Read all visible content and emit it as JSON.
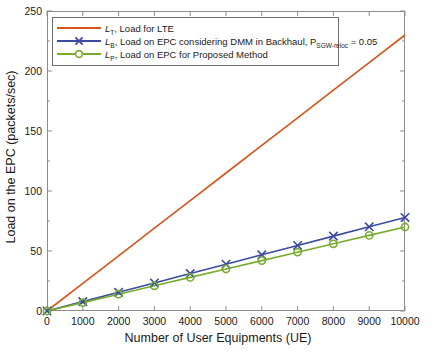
{
  "chart_data": {
    "type": "line",
    "title": "",
    "xlabel": "Number of User Equipments (UE)",
    "ylabel": "Load on the EPC (packets/sec)",
    "xlim": [
      0,
      10000
    ],
    "ylim": [
      0,
      250
    ],
    "xticks": [
      0,
      1000,
      2000,
      3000,
      4000,
      5000,
      6000,
      7000,
      8000,
      9000,
      10000
    ],
    "yticks": [
      0,
      50,
      100,
      150,
      200,
      250
    ],
    "grid": false,
    "legend_position": "upper-left",
    "x": [
      0,
      1000,
      2000,
      3000,
      4000,
      5000,
      6000,
      7000,
      8000,
      9000,
      10000
    ],
    "series": [
      {
        "name": "L_T, Load for LTE",
        "color": "#d95319",
        "marker": "none",
        "values": [
          0,
          23,
          46,
          69,
          92,
          115,
          138,
          161,
          184,
          207,
          230
        ]
      },
      {
        "name": "L_B, Load on EPC considering DMM in Backhaul, P_SGW-reloc = 0.05",
        "color": "#3b4ca0",
        "marker": "x",
        "values": [
          0,
          7.8,
          15.6,
          23.4,
          31.2,
          39,
          46.8,
          54.6,
          62.4,
          70.2,
          78
        ]
      },
      {
        "name": "L_P, Load on EPC for Proposed Method",
        "color": "#77ac30",
        "marker": "o",
        "values": [
          0,
          7,
          14,
          21,
          28,
          35,
          42,
          49,
          56,
          63,
          70
        ]
      }
    ]
  },
  "axes": {
    "ylabel": "Load on the EPC (packets/sec)",
    "xlabel": "Number of User Equipments (UE)",
    "yticks": [
      "0",
      "50",
      "100",
      "150",
      "200",
      "250"
    ],
    "xticks": [
      "0",
      "1000",
      "2000",
      "3000",
      "4000",
      "5000",
      "6000",
      "7000",
      "8000",
      "9000",
      "10000"
    ]
  },
  "legend": {
    "entries": [
      {
        "symbol": "L",
        "subscript": "T",
        "text": ", Load for LTE",
        "color": "#d95319",
        "marker": "none"
      },
      {
        "symbol": "L",
        "subscript": "B",
        "text": ", Load on EPC considering DMM in Backhaul, P",
        "text2_subscript": "SGW-reloc",
        "text2": " = 0.05",
        "color": "#3b4ca0",
        "marker": "x"
      },
      {
        "symbol": "L",
        "subscript": "P",
        "text": ", Load on EPC for Proposed Method",
        "color": "#77ac30",
        "marker": "o"
      }
    ]
  },
  "colors": {
    "lte": "#d95319",
    "backhaul": "#3b4ca0",
    "proposed": "#77ac30",
    "axis": "#8c8c8c",
    "text": "#1a1a1a"
  }
}
